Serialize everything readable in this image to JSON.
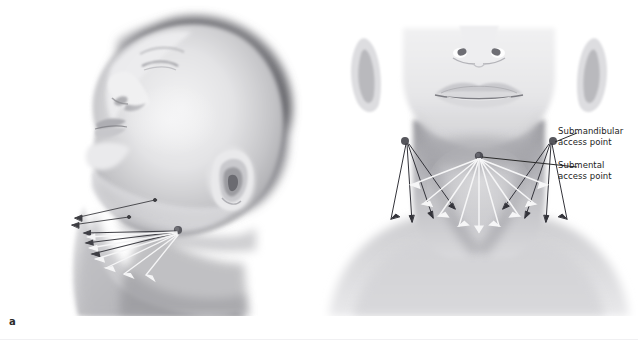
{
  "figure": {
    "panels": [
      {
        "letter": "a",
        "view": "lateral profile view of head and neck, chin elevated",
        "description": "Left lateral view showing submandibular access point with fan-shaped cannula tunnels directed anteriorly toward the submental region"
      },
      {
        "letter": "b",
        "view": "frontal view of lower face and neck",
        "description": "Anterior view showing bilateral submandibular access points and a central submental access point with radiating fan of cannula tunnels across the neck"
      }
    ],
    "annotations": [
      {
        "id": "submandibular",
        "line1": "Submandibular",
        "line2": "access point",
        "leader_color": "#2a2a2a"
      },
      {
        "id": "submental",
        "line1": "Submental",
        "line2": "access point",
        "leader_color": "#2a2a2a"
      }
    ],
    "colors": {
      "background": "#ffffff",
      "skin_light": "#ededee",
      "skin_mid": "#cfcfd1",
      "skin_shadow": "#9a9a9d",
      "skin_deep_shadow": "#6f7073",
      "hair_dark": "#4a4a4d",
      "access_point_dot": "#57575c",
      "arrow_light": "#f4f4f4",
      "arrow_dark": "#3a3a3e",
      "text": "#1d1d1d"
    },
    "cut_caption_ghost": " "
  }
}
